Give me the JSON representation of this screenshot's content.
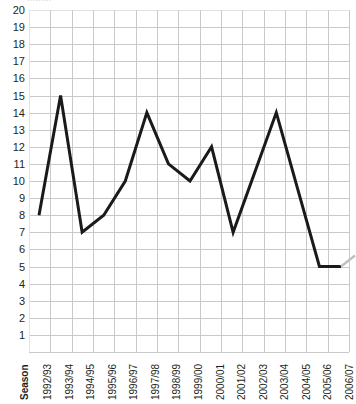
{
  "chart_data": {
    "type": "line",
    "title": "",
    "subtitle": "",
    "xlabel": "Season",
    "ylabel": "",
    "categories": [
      "1992/93",
      "1993/94",
      "1994/95",
      "1995/96",
      "1996/97",
      "1997/98",
      "1998/99",
      "1999/00",
      "2000/01",
      "2001/02",
      "2002/03",
      "2003/04",
      "2004/05",
      "2005/06",
      "2006/07"
    ],
    "values": [
      8,
      15,
      7,
      8,
      10,
      14,
      11,
      10,
      12,
      7,
      10.5,
      14,
      9.5,
      5,
      5
    ],
    "series": [
      {
        "name": "Finishing position",
        "values": [
          8,
          15,
          7,
          8,
          10,
          14,
          11,
          10,
          12,
          7,
          10.5,
          14,
          9.5,
          5,
          5
        ]
      }
    ],
    "ylim": [
      0,
      20
    ],
    "xlim": [
      0,
      15
    ],
    "yticks": [
      20,
      19,
      18,
      17,
      16,
      15,
      14,
      13,
      12,
      11,
      10,
      9,
      8,
      7,
      6,
      5,
      4,
      3,
      2,
      1
    ],
    "ytick_labels": [
      "20",
      "19",
      "18",
      "17",
      "16",
      "15",
      "14",
      "13",
      "12",
      "11",
      "10",
      "9",
      "8",
      "7",
      "6",
      "5",
      "4",
      "3",
      "2",
      "1"
    ],
    "grid": true,
    "grid_color": "#c9c9c9",
    "legend": false,
    "legend_position": "none",
    "line_color": "#1a1a1a",
    "line_width": 3,
    "markers": false,
    "annotations": []
  },
  "axis": {
    "x_header_label": "Season",
    "top_clipped_text": "·········"
  }
}
